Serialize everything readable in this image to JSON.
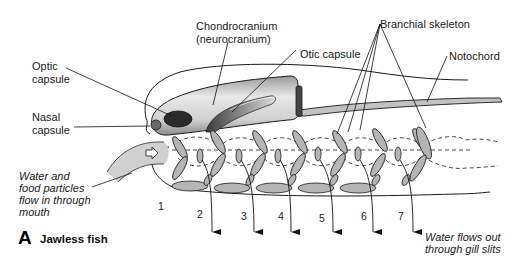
{
  "figure": {
    "panel_letter": "A",
    "panel_title": "Jawless fish"
  },
  "labels": {
    "chondrocranium_line1": "Chondrocranium",
    "chondrocranium_line2": "(neurocranium)",
    "branchial_skeleton": "Branchial skeleton",
    "otic_capsule": "Otic capsule",
    "notochord": "Notochord",
    "optic_capsule_line1": "Optic",
    "optic_capsule_line2": "capsule",
    "nasal_capsule_line1": "Nasal",
    "nasal_capsule_line2": "capsule",
    "water_in_line1": "Water and",
    "water_in_line2": "food particles",
    "water_in_line3": "flow in through",
    "water_in_line4": "mouth",
    "water_out_line1": "Water flows out",
    "water_out_line2": "through gill slits"
  },
  "gill_slits": [
    "1",
    "2",
    "3",
    "4",
    "5",
    "6",
    "7"
  ],
  "colors": {
    "cartilage_fill": "#b5b5b5",
    "stroke": "#1a1a1a",
    "cranium_light": "#f0f0f0",
    "cranium_dark": "#5a5a5a"
  }
}
